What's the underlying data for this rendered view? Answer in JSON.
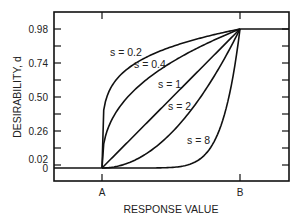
{
  "chart_data": {
    "type": "line",
    "title": "",
    "xlabel": "RESPONSE VALUE",
    "ylabel": "DESIRABILITY, d",
    "x_tick_labels": [
      "A",
      "B"
    ],
    "y_tick_labels": [
      "0",
      "0.02",
      "0.26",
      "0.50",
      "0.74",
      "0.98"
    ],
    "y_ticks": [
      0,
      0.02,
      0.14,
      0.26,
      0.38,
      0.5,
      0.62,
      0.74,
      0.86,
      0.98
    ],
    "ylim": [
      0,
      1
    ],
    "grid": false,
    "legend": "inline labels on curves",
    "formula": "d = ((y - A) / (B - A))^s for A <= y <= B; d = 0 below A; d = 1 above B",
    "series": [
      {
        "name": "s = 0.2",
        "s": 0.2
      },
      {
        "name": "s = 0.4",
        "s": 0.4
      },
      {
        "name": "s = 1",
        "s": 1
      },
      {
        "name": "s = 2",
        "s": 2
      },
      {
        "name": "s = 8",
        "s": 8
      }
    ]
  },
  "labels": {
    "xlabel": "RESPONSE VALUE",
    "ylabel": "DESIRABILITY, d",
    "xA": "A",
    "xB": "B",
    "y0": "0",
    "y002": "0.02",
    "y026": "0.26",
    "y050": "0.50",
    "y074": "0.74",
    "y098": "0.98",
    "s02": "s = 0.2",
    "s04": "s = 0.4",
    "s1": "s = 1",
    "s2": "s = 2",
    "s8": "s = 8"
  }
}
